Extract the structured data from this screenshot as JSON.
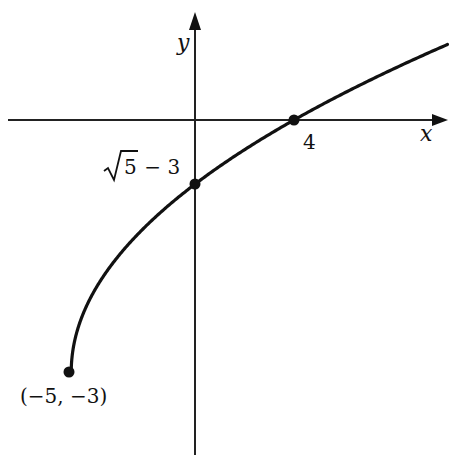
{
  "chart_data": {
    "type": "line",
    "title": "",
    "function": "y = sqrt(x + 5) - 3",
    "xlabel": "x",
    "ylabel": "y",
    "xlim": [
      -7.8,
      10.2
    ],
    "ylim": [
      -4.0,
      1.3
    ],
    "grid": false,
    "legend": null,
    "points": [
      {
        "x": -5,
        "y": -3,
        "label": "(−5, −3)"
      },
      {
        "x": 0,
        "y": -0.764,
        "label": "√5 − 3"
      },
      {
        "x": 4,
        "y": 0,
        "label": "4"
      }
    ],
    "curve_samples": {
      "x": [
        -5,
        -4.5,
        -4,
        -3,
        -2,
        -1,
        0,
        1,
        2,
        3,
        4,
        5,
        6,
        7,
        8,
        9,
        10
      ],
      "y": [
        -3,
        -2.293,
        -2,
        -1.586,
        -1.354,
        -0.551,
        -0.764,
        -0.551,
        -0.354,
        -0.172,
        0,
        0.162,
        0.317,
        0.464,
        0.606,
        0.742,
        0.873
      ]
    },
    "annotations": {
      "y_intercept": {
        "radical": "5",
        "rest": " − 3"
      },
      "x_intercept": "4",
      "endpoint": "(−5, −3)"
    },
    "colors": {
      "curve": "#111111",
      "axes": "#222222",
      "background": "#ffffff"
    }
  }
}
